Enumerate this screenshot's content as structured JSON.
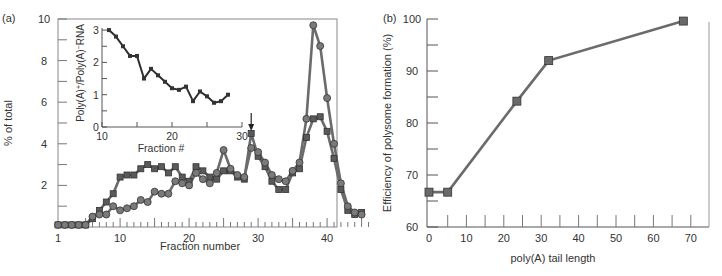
{
  "chart_data": [
    {
      "panel_label": "(a)",
      "type": "line",
      "xlabel": "Fraction number",
      "ylabel": "% of total",
      "xlim": [
        1,
        46
      ],
      "ylim": [
        0,
        10
      ],
      "xticks": [
        1,
        10,
        20,
        30,
        40
      ],
      "yticks": [
        2,
        4,
        6,
        8,
        10
      ],
      "grid": false,
      "arrow_annotation_at_fraction": 29,
      "x": [
        1,
        2,
        3,
        4,
        5,
        6,
        7,
        8,
        9,
        10,
        11,
        12,
        13,
        14,
        15,
        16,
        17,
        18,
        19,
        20,
        21,
        22,
        23,
        24,
        25,
        26,
        27,
        28,
        29,
        30,
        31,
        32,
        33,
        34,
        35,
        36,
        37,
        38,
        39,
        40,
        41,
        42,
        43,
        44,
        45
      ],
      "series": [
        {
          "name": "squares",
          "marker": "square",
          "values": [
            0.1,
            0.1,
            0.1,
            0.1,
            0.1,
            0.4,
            0.8,
            1.2,
            1.6,
            2.4,
            2.5,
            2.5,
            2.8,
            3.0,
            2.8,
            2.9,
            2.6,
            2.9,
            2.4,
            2.2,
            2.9,
            2.7,
            2.4,
            2.3,
            2.7,
            2.7,
            2.4,
            2.3,
            4.5,
            3.4,
            2.9,
            2.2,
            1.8,
            1.8,
            2.6,
            2.8,
            4.3,
            5.2,
            5.3,
            4.6,
            3.3,
            1.8,
            0.8,
            0.6,
            0.7
          ]
        },
        {
          "name": "circles",
          "marker": "circle",
          "values": [
            0.1,
            0.1,
            0.1,
            0.1,
            0.1,
            0.5,
            0.6,
            0.6,
            1.0,
            0.8,
            0.9,
            1.0,
            1.3,
            1.2,
            1.7,
            1.6,
            1.6,
            2.2,
            2.1,
            2.0,
            2.6,
            2.3,
            2.1,
            2.6,
            3.7,
            2.8,
            2.5,
            2.4,
            3.8,
            3.6,
            3.1,
            2.5,
            2.3,
            2.2,
            2.7,
            3.1,
            5.2,
            9.7,
            8.7,
            6.2,
            4.0,
            2.1,
            1.0,
            0.7,
            0.6
          ]
        }
      ],
      "inset": {
        "type": "line",
        "xlabel": "Fraction #",
        "ylabel": "Poly(A)+/Poly(A)−RNA",
        "xlim": [
          10,
          30
        ],
        "ylim": [
          0,
          3
        ],
        "xticks": [
          10,
          20,
          30
        ],
        "yticks": [
          0,
          1,
          2,
          3
        ],
        "x": [
          11,
          12,
          13,
          14,
          15,
          16,
          17,
          18,
          19,
          20,
          21,
          22,
          23,
          24,
          25,
          26,
          27,
          28
        ],
        "values": [
          3.0,
          2.8,
          2.5,
          2.2,
          2.2,
          1.5,
          1.8,
          1.6,
          1.4,
          1.2,
          1.15,
          1.25,
          0.8,
          1.1,
          0.95,
          0.75,
          0.8,
          1.0
        ]
      }
    },
    {
      "panel_label": "(b)",
      "type": "line",
      "xlabel": "poly(A) tail length",
      "ylabel": "Efficiency of polysome formation (%)",
      "xlim": [
        0,
        75
      ],
      "ylim": [
        60,
        100
      ],
      "xticks": [
        0,
        10,
        20,
        30,
        40,
        50,
        60,
        70
      ],
      "yticks": [
        60,
        70,
        80,
        90,
        100
      ],
      "grid": false,
      "x": [
        0,
        5,
        23.5,
        32,
        68
      ],
      "values": [
        66.7,
        66.7,
        84.2,
        92.0,
        99.6
      ]
    }
  ],
  "labels": {
    "panel_a": "(a)",
    "panel_b": "(b)",
    "a_xlabel": "Fraction number",
    "a_ylabel": "% of total",
    "inset_xlabel": "Fraction #",
    "inset_ylabel_pre": "Poly(A)",
    "inset_ylabel_sup1": "+",
    "inset_ylabel_mid": "/Poly(A)",
    "inset_ylabel_sup2": "−",
    "inset_ylabel_post": "RNA",
    "b_xlabel": "poly(A) tail length",
    "b_ylabel": "Efficiency of polysome formation (%)"
  },
  "colors": {
    "line": "#6b6b6b",
    "marker": "#5a5a5a",
    "axis": "#555555",
    "inset_line": "#2e2e2e"
  }
}
